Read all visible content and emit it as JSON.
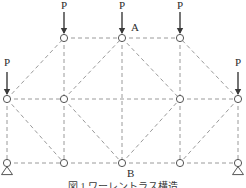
{
  "figure": {
    "type": "truss-diagram",
    "caption": "図 1  ワーレントラス構造",
    "colors": {
      "member": "#9a9a9a",
      "node_stroke": "#555555",
      "node_fill": "#ffffff",
      "arrow": "#3a3a3a",
      "text": "#2b2b2b"
    },
    "geometry": {
      "rows": {
        "top_y": 38,
        "mid_y": 99,
        "bottom_y": 163
      },
      "columns_x": [
        7,
        64,
        122,
        180,
        238
      ]
    }
  },
  "nodes": [
    {
      "id": "T1",
      "x": 64,
      "y": 38,
      "label": "",
      "support": "none"
    },
    {
      "id": "T2",
      "x": 122,
      "y": 38,
      "label": "A",
      "support": "none"
    },
    {
      "id": "T3",
      "x": 180,
      "y": 38,
      "label": "",
      "support": "none"
    },
    {
      "id": "M0",
      "x": 7,
      "y": 99,
      "label": "",
      "support": "none"
    },
    {
      "id": "M1",
      "x": 64,
      "y": 99,
      "label": "",
      "support": "none"
    },
    {
      "id": "M3",
      "x": 180,
      "y": 99,
      "label": "",
      "support": "none"
    },
    {
      "id": "M4",
      "x": 238,
      "y": 99,
      "label": "",
      "support": "none"
    },
    {
      "id": "B0",
      "x": 7,
      "y": 163,
      "label": "",
      "support": "pin"
    },
    {
      "id": "B1",
      "x": 64,
      "y": 163,
      "label": "",
      "support": "none"
    },
    {
      "id": "B2",
      "x": 122,
      "y": 163,
      "label": "B",
      "support": "none"
    },
    {
      "id": "B3",
      "x": 180,
      "y": 163,
      "label": "",
      "support": "none"
    },
    {
      "id": "B4",
      "x": 238,
      "y": 163,
      "label": "",
      "support": "pin"
    }
  ],
  "members": [
    {
      "from": "T1",
      "to": "T2"
    },
    {
      "from": "T2",
      "to": "T3"
    },
    {
      "from": "M0",
      "to": "M1"
    },
    {
      "from": "M1",
      "to": "M3"
    },
    {
      "from": "M3",
      "to": "M4"
    },
    {
      "from": "B0",
      "to": "B1"
    },
    {
      "from": "B1",
      "to": "B2"
    },
    {
      "from": "B2",
      "to": "B3"
    },
    {
      "from": "B3",
      "to": "B4"
    },
    {
      "from": "T1",
      "to": "M1"
    },
    {
      "from": "M1",
      "to": "B1"
    },
    {
      "from": "T2",
      "to": "B2"
    },
    {
      "from": "T3",
      "to": "M3"
    },
    {
      "from": "M3",
      "to": "B3"
    },
    {
      "from": "M0",
      "to": "B0"
    },
    {
      "from": "M4",
      "to": "B4"
    },
    {
      "from": "M0",
      "to": "T1"
    },
    {
      "from": "M0",
      "to": "B1"
    },
    {
      "from": "M4",
      "to": "T3"
    },
    {
      "from": "M4",
      "to": "B3"
    },
    {
      "from": "M1",
      "to": "T2"
    },
    {
      "from": "T2",
      "to": "M3"
    },
    {
      "from": "M1",
      "to": "B2"
    },
    {
      "from": "B2",
      "to": "M3"
    }
  ],
  "loads": [
    {
      "id": "P-left",
      "label": "P",
      "node": "M0",
      "x": 7,
      "tip_y": 99,
      "tail_y": 72,
      "text_y": 57
    },
    {
      "id": "P-top1",
      "label": "P",
      "node": "T1",
      "x": 64,
      "tip_y": 38,
      "tail_y": 12,
      "text_y": 0
    },
    {
      "id": "P-top2",
      "label": "P",
      "node": "T2",
      "x": 122,
      "tip_y": 38,
      "tail_y": 12,
      "text_y": 0
    },
    {
      "id": "P-top3",
      "label": "P",
      "node": "T3",
      "x": 180,
      "tip_y": 38,
      "tail_y": 12,
      "text_y": 0
    },
    {
      "id": "P-right",
      "label": "P",
      "node": "M4",
      "x": 238,
      "tip_y": 99,
      "tail_y": 72,
      "text_y": 57
    }
  ],
  "annotations": [
    {
      "id": "label-A",
      "text": "A",
      "x": 131,
      "y": 22
    },
    {
      "id": "label-B",
      "text": "B",
      "x": 127,
      "y": 168
    }
  ]
}
